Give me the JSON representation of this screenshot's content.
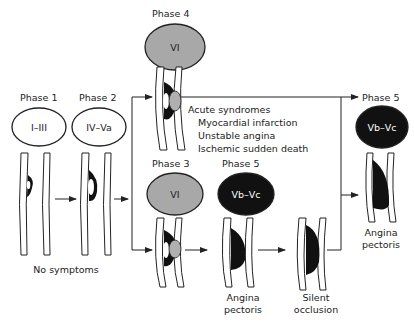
{
  "colors": {
    "line": "#222222",
    "ring_fill_white": "#ffffff",
    "ring_fill_gray": "#a8a8a8",
    "ring_fill_black": "#111111",
    "lesion_black": "#111111",
    "thrombus_gray": "#b0b0b0"
  },
  "stages": [
    {
      "id": "phase1",
      "phase": "Phase 1",
      "lesion_types": "I–III",
      "style": "white"
    },
    {
      "id": "phase2",
      "phase": "Phase 2",
      "lesion_types": "IV–Va",
      "style": "white"
    },
    {
      "id": "phase4",
      "phase": "Phase 4",
      "lesion_types": "VI",
      "style": "gray"
    },
    {
      "id": "phase3",
      "phase": "Phase 3",
      "lesion_types": "VI",
      "style": "gray"
    },
    {
      "id": "phase5a",
      "phase": "Phase 5",
      "lesion_types": "Vb–Vc",
      "style": "black"
    },
    {
      "id": "phase5b",
      "phase": "Phase 5",
      "lesion_types": "Vb–Vc",
      "style": "black"
    }
  ],
  "captions": {
    "no_symptoms": "No symptoms",
    "acute_title": "Acute syndromes",
    "acute_items": [
      "Myocardial infarction",
      "Unstable angina",
      "Ischemic sudden death"
    ],
    "angina_1_line1": "Angina",
    "angina_1_line2": "pectoris",
    "silent_line1": "Silent",
    "silent_line2": "occlusion",
    "angina_2_line1": "Angina",
    "angina_2_line2": "pectoris"
  }
}
